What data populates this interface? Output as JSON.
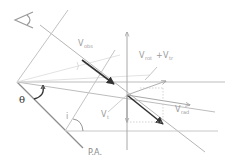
{
  "diagram": {
    "title": "",
    "colors": {
      "background": "#ffffff",
      "light_line": "#c8c8c8",
      "mid_line": "#a6a6a6",
      "dark_line": "#444444",
      "label": "#9a9a9a"
    },
    "labels": {
      "v_obs_main": "V",
      "v_obs_sub": "obs",
      "v_rot_tr_main_1": "V",
      "v_rot_tr_sub_1": "rot",
      "v_rot_tr_plus": "+",
      "v_rot_tr_main_2": "V",
      "v_rot_tr_sub_2": "tr",
      "v_rad_main": "V",
      "v_rad_sub": "rad",
      "v_t_main": "V",
      "v_t_sub": "t",
      "theta": "θ",
      "inclination": "i",
      "position_angle": "P.A."
    },
    "icons": {
      "observer": "eye-icon"
    }
  }
}
